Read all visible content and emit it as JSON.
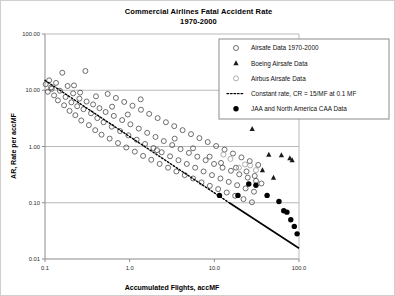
{
  "chart_data": {
    "type": "scatter",
    "title": "Commercial Airlines Fatal Accident Rate",
    "subtitle": "1970-2000",
    "xlabel": "Accumulated Flights, accMF",
    "ylabel": "AR, Rate per accMF",
    "xscale": "log",
    "yscale": "log",
    "xlim": [
      0.1,
      100.0
    ],
    "ylim": [
      0.01,
      100.0
    ],
    "grid": true,
    "xticks": [
      "0.1",
      "1.0",
      "10.0",
      "100.0"
    ],
    "xtick_values": [
      0.1,
      1.0,
      10.0,
      100.0
    ],
    "yticks": [
      "100.00",
      "10.00",
      "1.00",
      "0.10",
      "0.01"
    ],
    "ytick_values": [
      100.0,
      10.0,
      1.0,
      0.1,
      0.01
    ],
    "legend_position": "top-right",
    "series": [
      {
        "name": "Airsafe Data 1970-2000",
        "marker": "open-circle",
        "color": "#4a4a4a",
        "points": [
          [
            0.102,
            12.8
          ],
          [
            0.108,
            9.4
          ],
          [
            0.112,
            15.0
          ],
          [
            0.118,
            11.2
          ],
          [
            0.128,
            8.1
          ],
          [
            0.135,
            13.5
          ],
          [
            0.142,
            6.6
          ],
          [
            0.15,
            9.8
          ],
          [
            0.16,
            20.5
          ],
          [
            0.168,
            5.4
          ],
          [
            0.175,
            7.6
          ],
          [
            0.185,
            11.9
          ],
          [
            0.195,
            4.3
          ],
          [
            0.205,
            6.1
          ],
          [
            0.215,
            8.8
          ],
          [
            0.228,
            3.6
          ],
          [
            0.24,
            5.2
          ],
          [
            0.255,
            7.1
          ],
          [
            0.268,
            2.9
          ],
          [
            0.285,
            4.6
          ],
          [
            0.3,
            22.0
          ],
          [
            0.31,
            6.3
          ],
          [
            0.33,
            2.4
          ],
          [
            0.35,
            3.9
          ],
          [
            0.37,
            5.6
          ],
          [
            0.392,
            1.95
          ],
          [
            0.415,
            3.2
          ],
          [
            0.44,
            4.8
          ],
          [
            0.465,
            1.62
          ],
          [
            0.492,
            2.7
          ],
          [
            0.52,
            4.1
          ],
          [
            0.55,
            8.6
          ],
          [
            0.58,
            1.38
          ],
          [
            0.615,
            2.25
          ],
          [
            0.65,
            3.5
          ],
          [
            0.688,
            7.3
          ],
          [
            0.728,
            1.15
          ],
          [
            0.77,
            1.88
          ],
          [
            0.815,
            2.95
          ],
          [
            0.862,
            6.2
          ],
          [
            0.912,
            0.96
          ],
          [
            0.965,
            1.58
          ],
          [
            1.02,
            2.48
          ],
          [
            1.08,
            5.3
          ],
          [
            1.15,
            0.81
          ],
          [
            1.21,
            1.32
          ],
          [
            1.28,
            2.08
          ],
          [
            1.36,
            4.5
          ],
          [
            1.44,
            0.68
          ],
          [
            1.52,
            1.11
          ],
          [
            1.61,
            1.75
          ],
          [
            1.7,
            3.8
          ],
          [
            1.8,
            0.58
          ],
          [
            1.91,
            0.94
          ],
          [
            2.02,
            1.48
          ],
          [
            2.14,
            3.2
          ],
          [
            2.26,
            0.49
          ],
          [
            2.39,
            0.79
          ],
          [
            2.53,
            1.25
          ],
          [
            2.68,
            2.7
          ],
          [
            2.84,
            0.42
          ],
          [
            3.0,
            0.67
          ],
          [
            3.18,
            1.06
          ],
          [
            3.36,
            2.3
          ],
          [
            3.56,
            0.36
          ],
          [
            3.77,
            0.57
          ],
          [
            3.99,
            0.9
          ],
          [
            4.22,
            1.95
          ],
          [
            4.47,
            0.31
          ],
          [
            4.73,
            0.49
          ],
          [
            5.01,
            0.77
          ],
          [
            5.3,
            1.66
          ],
          [
            5.61,
            0.27
          ],
          [
            5.94,
            0.42
          ],
          [
            6.29,
            0.66
          ],
          [
            6.66,
            1.41
          ],
          [
            7.05,
            0.23
          ],
          [
            7.46,
            0.36
          ],
          [
            7.9,
            0.57
          ],
          [
            8.36,
            1.2
          ],
          [
            8.85,
            0.2
          ],
          [
            9.37,
            0.31
          ],
          [
            9.92,
            0.49
          ],
          [
            10.5,
            1.02
          ],
          [
            11.1,
            0.175
          ],
          [
            11.8,
            0.27
          ],
          [
            12.5,
            0.42
          ],
          [
            13.2,
            0.88
          ],
          [
            14.0,
            0.152
          ],
          [
            14.8,
            0.235
          ],
          [
            15.7,
            0.37
          ],
          [
            16.6,
            0.75
          ],
          [
            17.6,
            0.133
          ],
          [
            18.6,
            0.205
          ],
          [
            19.7,
            0.32
          ],
          [
            20.9,
            0.64
          ],
          [
            22.1,
            0.116
          ],
          [
            23.4,
            0.18
          ],
          [
            24.8,
            0.28
          ],
          [
            26.2,
            0.55
          ],
          [
            27.8,
            0.102
          ],
          [
            29.4,
            0.157
          ],
          [
            31.1,
            0.245
          ],
          [
            33.0,
            0.47
          ],
          [
            0.12,
            10.6
          ],
          [
            0.22,
            12.2
          ],
          [
            0.26,
            9.1
          ],
          [
            0.4,
            7.8
          ],
          [
            0.62,
            5.1
          ],
          [
            0.95,
            3.7
          ],
          [
            1.35,
            6.9
          ],
          [
            2.1,
            0.86
          ],
          [
            3.4,
            1.38
          ],
          [
            5.6,
            0.93
          ],
          [
            8.8,
            0.66
          ],
          [
            12.0,
            0.51
          ],
          [
            18.0,
            0.42
          ],
          [
            24.0,
            0.36
          ],
          [
            30.0,
            0.3
          ],
          [
            36.0,
            0.22
          ]
        ]
      },
      {
        "name": "Boeing Airsafe Data",
        "marker": "filled-triangle",
        "color": "#1a1a1a",
        "points": [
          [
            28.0,
            2.05
          ],
          [
            44.0,
            0.72
          ],
          [
            62.0,
            0.7
          ],
          [
            78.0,
            0.62
          ],
          [
            83.0,
            0.57
          ],
          [
            37.0,
            0.38
          ],
          [
            50.0,
            0.28
          ]
        ]
      },
      {
        "name": "Airbus Airsafe Data",
        "marker": "open-circle-light",
        "color": "#9a9a9a",
        "points": [
          [
            19.5,
            0.42
          ],
          [
            23.0,
            0.48
          ],
          [
            26.5,
            0.46
          ],
          [
            31.0,
            0.38
          ],
          [
            15.5,
            0.6
          ],
          [
            12.8,
            0.72
          ]
        ]
      },
      {
        "name": "JAA and North America CAA Data",
        "marker": "filled-circle",
        "color": "#000000",
        "points": [
          [
            11.5,
            0.135
          ],
          [
            19.0,
            0.135
          ],
          [
            25.5,
            0.215
          ],
          [
            31.0,
            0.205
          ],
          [
            42.0,
            0.135
          ],
          [
            58.0,
            0.105
          ],
          [
            66.0,
            0.072
          ],
          [
            72.0,
            0.068
          ],
          [
            80.0,
            0.05
          ],
          [
            88.0,
            0.038
          ],
          [
            95.0,
            0.028
          ]
        ]
      }
    ],
    "reference_lines": [
      {
        "name": "Constant rate, CR = 15/MF at 0.1 MF",
        "style": "dashed",
        "color": "#000000",
        "from": [
          0.1,
          15.0
        ],
        "to": [
          15.0,
          0.1
        ]
      },
      {
        "name": "Constant rate extension",
        "style": "solid",
        "color": "#000000",
        "from": [
          15.0,
          0.1
        ],
        "to": [
          100.0,
          0.0155
        ]
      }
    ]
  },
  "legend": {
    "items": [
      {
        "label": "Airsafe Data 1970-2000",
        "marker": "open-circle"
      },
      {
        "label": "Boeing Airsafe Data",
        "marker": "filled-triangle"
      },
      {
        "label": "Airbus Airsafe Data",
        "marker": "open-circle-light"
      },
      {
        "label": "Constant rate, CR = 15/MF at 0.1 MF",
        "marker": "dashed-line"
      },
      {
        "label": "JAA and North America CAA Data",
        "marker": "filled-circle"
      }
    ]
  }
}
